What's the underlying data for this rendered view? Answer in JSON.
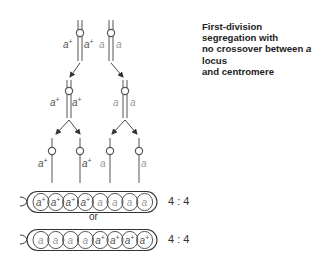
{
  "title": {
    "line1": "First-division segregation with",
    "line2_pre": "no crossover between ",
    "line2_italic": "a",
    "line2_post": " locus",
    "line3": "and centromere"
  },
  "alleles": {
    "dominant": "a",
    "dominant_sup": "+",
    "recessive": "a"
  },
  "stages": {
    "meiosis_start": {
      "chromatids": [
        "a+",
        "a+",
        "a",
        "a"
      ]
    },
    "after_division_1": {
      "left": [
        "a+",
        "a+"
      ],
      "right": [
        "a",
        "a"
      ]
    },
    "after_division_2": [
      "a+",
      "a+",
      "a",
      "a"
    ]
  },
  "asci": [
    {
      "spores": [
        "a+",
        "a+",
        "a+",
        "a+",
        "a",
        "a",
        "a",
        "a"
      ],
      "ratio": "4 : 4"
    },
    {
      "spores": [
        "a",
        "a",
        "a",
        "a",
        "a+",
        "a+",
        "a+",
        "a+"
      ],
      "ratio": "4 : 4"
    }
  ],
  "separator": "or",
  "colors": {
    "dominant_label": "#555555",
    "recessive_label": "#9a9a9a",
    "line": "#555555"
  }
}
